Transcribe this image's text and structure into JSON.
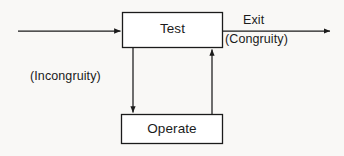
{
  "diagram": {
    "background_color": "#f9f8f6",
    "stroke_color": "#1b1b1b",
    "nodes": [
      {
        "id": "test",
        "label": "Test",
        "shape": "rectangle",
        "x": 122,
        "y": 12,
        "width": 101,
        "height": 36
      },
      {
        "id": "operate",
        "label": "Operate",
        "shape": "rectangle",
        "x": 121,
        "y": 114,
        "width": 102,
        "height": 30
      }
    ],
    "edges": [
      {
        "id": "input",
        "label": "",
        "from": "",
        "to": "test",
        "direction": "right",
        "arrowhead": true
      },
      {
        "id": "exit",
        "label": "Exit",
        "sublabel": "(Congruity)",
        "from": "test",
        "to": "",
        "direction": "right",
        "arrowhead": true
      },
      {
        "id": "incongruity",
        "label": "(Incongruity)",
        "from": "test",
        "to": "operate",
        "direction": "down",
        "arrowhead": true
      },
      {
        "id": "return",
        "label": "",
        "from": "operate",
        "to": "test",
        "direction": "up",
        "arrowhead": true
      }
    ]
  }
}
